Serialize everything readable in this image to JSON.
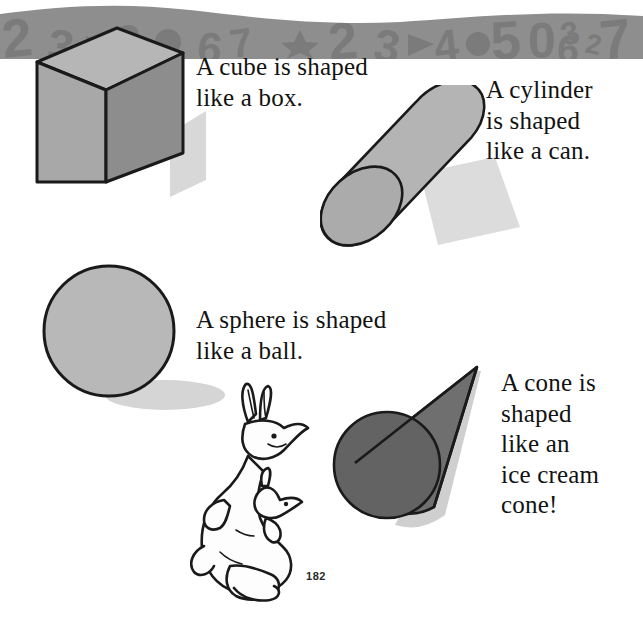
{
  "page": {
    "number": "182",
    "background_color": "#ffffff",
    "width": 643,
    "height": 637
  },
  "captions": {
    "cube": "A cube is shaped\nlike a box.",
    "cylinder": "A cylinder\nis shaped\nlike a can.",
    "sphere": "A sphere is shaped\nlike a ball.",
    "cone": "A cone is\nshaped\nlike an\nice cream\ncone!"
  },
  "shapes": [
    {
      "name": "cube",
      "label": "cube",
      "faces": {
        "top": "#b6b6b6",
        "front": "#a8a8a8",
        "side": "#8d8d8d"
      },
      "outline": "#1a1a1a",
      "shadow": "#d8d8d8"
    },
    {
      "name": "cylinder",
      "label": "cylinder",
      "body": "#b4b4b4",
      "end_cap": "#ababab",
      "outline": "#1a1a1a",
      "shadow": "#dcdcdc"
    },
    {
      "name": "sphere",
      "label": "sphere",
      "body": "#b8b8b8",
      "outline": "#1a1a1a",
      "shadow": "#d5d5d5"
    },
    {
      "name": "cone",
      "label": "cone",
      "body": "#6f6f6f",
      "base": "#636363",
      "outline": "#1a1a1a",
      "shadow": "#cfcfcf"
    }
  ],
  "illustration": {
    "character": "kangaroo-with-joey",
    "fill": "#fdfdfd",
    "outline": "#1a1a1a"
  },
  "footer_border": {
    "band_color": "#8e8e8e",
    "pattern_color": "#7b7b7b",
    "pattern_glyphs": [
      "2",
      "3",
      "2",
      "3",
      "5",
      "0",
      "3",
      "2",
      "7",
      "6"
    ]
  }
}
